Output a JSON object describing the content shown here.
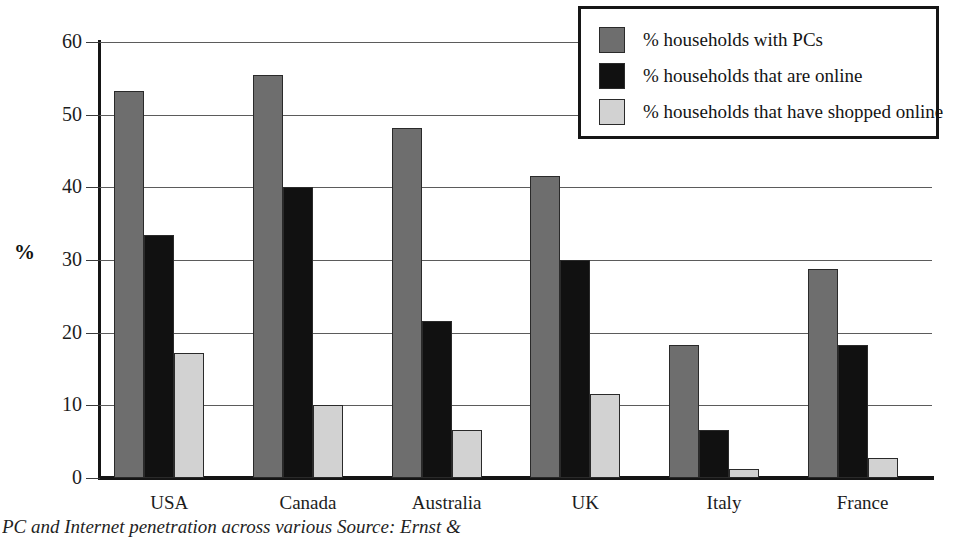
{
  "chart_data": {
    "type": "bar",
    "title": "",
    "xlabel": "",
    "ylabel": "%",
    "ylim": [
      0,
      60
    ],
    "yticks": [
      0,
      10,
      20,
      30,
      40,
      50,
      60
    ],
    "grid": true,
    "legend_position": "top-right",
    "categories": [
      "USA",
      "Canada",
      "Australia",
      "UK",
      "Italy",
      "France"
    ],
    "series": [
      {
        "name": "% households with PCs",
        "color": "#6e6e6e",
        "values": [
          53.2,
          55.5,
          48.2,
          41.5,
          18.3,
          28.7
        ]
      },
      {
        "name": "% households that are online",
        "color": "#111111",
        "values": [
          33.4,
          40.1,
          21.6,
          30.0,
          6.6,
          18.3
        ]
      },
      {
        "name": "% households that have shopped online",
        "color": "#d2d2d2",
        "values": [
          17.2,
          10.0,
          6.6,
          11.5,
          1.3,
          2.7
        ]
      }
    ]
  },
  "axis": {
    "y_title": "%",
    "y_tick_labels": [
      "0",
      "10",
      "20",
      "30",
      "40",
      "50",
      "60"
    ]
  },
  "legend": {
    "items": [
      {
        "label": "% households with PCs",
        "swatch": "dark-gray"
      },
      {
        "label": "% households that are online",
        "swatch": "black"
      },
      {
        "label": "% households that have shopped online",
        "swatch": "light-gray"
      }
    ]
  },
  "caption": {
    "text": "PC and Internet penetration across various        Source: Ernst &"
  }
}
